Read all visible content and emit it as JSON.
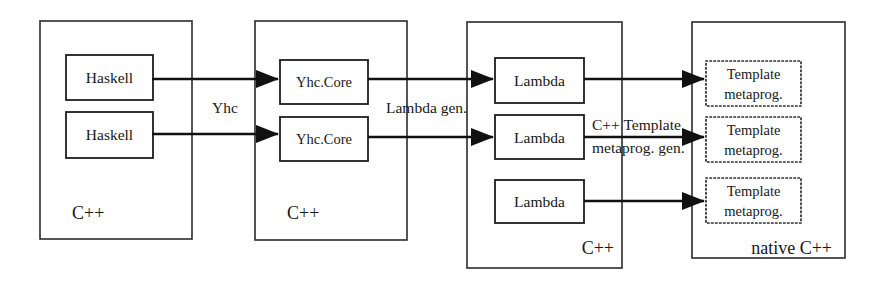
{
  "diagram": {
    "background_color": "#ffffff",
    "line_color": "#111111",
    "zones": [
      {
        "id": "zone-source",
        "label": "C++",
        "label_align": "left",
        "x": 40,
        "y": 21,
        "w": 152,
        "h": 218,
        "nodes": [
          {
            "id": "haskell-1",
            "label": "Haskell",
            "x": 66,
            "y": 55,
            "w": 87,
            "h": 45,
            "border": "solid"
          },
          {
            "id": "haskell-2",
            "label": "Haskell",
            "x": 66,
            "y": 112,
            "w": 87,
            "h": 46,
            "border": "solid"
          }
        ]
      },
      {
        "id": "zone-yhccore",
        "label": "C++",
        "label_align": "left",
        "x": 255,
        "y": 21,
        "w": 152,
        "h": 219,
        "nodes": [
          {
            "id": "yhccore-1",
            "label": "Yhc.Core",
            "x": 280,
            "y": 60,
            "w": 88,
            "h": 44,
            "border": "solid"
          },
          {
            "id": "yhccore-2",
            "label": "Yhc.Core",
            "x": 280,
            "y": 117,
            "w": 88,
            "h": 44,
            "border": "solid"
          }
        ]
      },
      {
        "id": "zone-lambda",
        "label": "C++",
        "label_align": "right",
        "x": 467,
        "y": 22,
        "w": 155,
        "h": 246,
        "nodes": [
          {
            "id": "lambda-1",
            "label": "Lambda",
            "x": 495,
            "y": 58,
            "w": 89,
            "h": 45,
            "border": "solid"
          },
          {
            "id": "lambda-2",
            "label": "Lambda",
            "x": 495,
            "y": 115,
            "w": 89,
            "h": 44,
            "border": "solid"
          },
          {
            "id": "lambda-3",
            "label": "Lambda",
            "x": 495,
            "y": 180,
            "w": 89,
            "h": 43,
            "border": "solid"
          }
        ]
      },
      {
        "id": "zone-native",
        "label": "native C++",
        "label_align": "right",
        "x": 692,
        "y": 22,
        "w": 153,
        "h": 236,
        "nodes": [
          {
            "id": "template-1",
            "label_line1": "Template",
            "label_line2": "metaprog.",
            "x": 706,
            "y": 61,
            "w": 95,
            "h": 45,
            "border": "dotted"
          },
          {
            "id": "template-2",
            "label_line1": "Template",
            "label_line2": "metaprog.",
            "x": 706,
            "y": 117,
            "w": 95,
            "h": 45,
            "border": "dotted"
          },
          {
            "id": "template-3",
            "label_line1": "Template",
            "label_line2": "metaprog.",
            "x": 706,
            "y": 178,
            "w": 95,
            "h": 45,
            "border": "dotted"
          }
        ]
      }
    ],
    "edges": [
      {
        "id": "edge-yhc-1",
        "from": "haskell-1",
        "to": "yhccore-1",
        "x1": 152,
        "x2": 278,
        "y": 79
      },
      {
        "id": "edge-yhc-2",
        "from": "haskell-2",
        "to": "yhccore-2",
        "x1": 152,
        "x2": 278,
        "y": 134
      },
      {
        "id": "edge-lambdagen-1",
        "from": "yhccore-1",
        "to": "lambda-1",
        "x1": 368,
        "x2": 493,
        "y": 79
      },
      {
        "id": "edge-lambdagen-2",
        "from": "yhccore-2",
        "to": "lambda-2",
        "x1": 368,
        "x2": 493,
        "y": 137
      },
      {
        "id": "edge-tmpgen-1",
        "from": "lambda-1",
        "to": "template-1",
        "x1": 584,
        "x2": 704,
        "y": 79
      },
      {
        "id": "edge-tmpgen-2",
        "from": "lambda-2",
        "to": "template-2",
        "x1": 584,
        "x2": 704,
        "y": 137
      },
      {
        "id": "edge-tmpgen-3",
        "from": "lambda-3",
        "to": "template-3",
        "x1": 584,
        "x2": 704,
        "y": 201
      }
    ],
    "edge_labels": [
      {
        "id": "label-yhc",
        "text": "Yhc",
        "x": 212,
        "y": 113
      },
      {
        "id": "label-lambda-gen",
        "text": "Lambda gen.",
        "x": 386,
        "y": 113
      },
      {
        "id": "label-tmp-gen-line1",
        "text": "C++ Template",
        "x": 592,
        "y": 130
      },
      {
        "id": "label-tmp-gen-line2",
        "text": "metaprog. gen.",
        "x": 592,
        "y": 153
      }
    ]
  }
}
